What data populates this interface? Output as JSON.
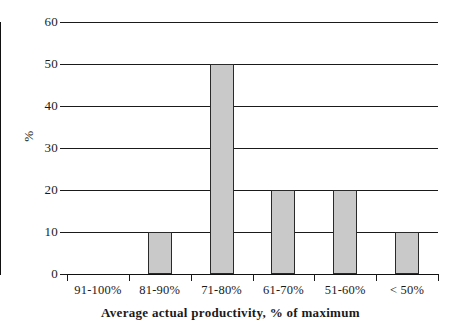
{
  "chart_data": {
    "type": "bar",
    "title": "",
    "xlabel": "Average actual productivity, % of maximum",
    "ylabel": "%",
    "categories": [
      "91-100%",
      "81-90%",
      "71-80%",
      "61-70%",
      "51-60%",
      "< 50%"
    ],
    "values": [
      0,
      10,
      50,
      20,
      20,
      10
    ],
    "ylim": [
      0,
      60
    ],
    "ytick_labels": [
      "60",
      "50",
      "40",
      "30",
      "20",
      "10",
      "0"
    ],
    "ytick_values": [
      60,
      50,
      40,
      30,
      20,
      10,
      0
    ],
    "ytick_step": 10,
    "grid": true,
    "grid_axis": "y",
    "legend": false,
    "legend_position": "none",
    "bar_fill_color": "#c9c9c9",
    "bar_border_color": "#2a2a2a",
    "axis_color": "#111111",
    "gridline_color": "#1a1a1a",
    "background_color": "#ffffff"
  }
}
